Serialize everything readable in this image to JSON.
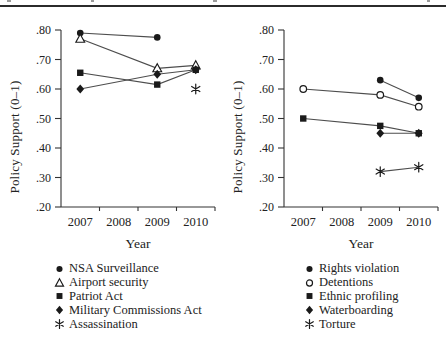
{
  "colors": {
    "ink": "#1a1a1a",
    "line": "#4d4d4d",
    "axis": "#333333",
    "text": "#222222",
    "rule": "#2b2b2b",
    "background": "#ffffff"
  },
  "chart_data": [
    {
      "type": "line",
      "panel": "left",
      "ylabel": "Policy Support (0–1)",
      "xlabel": "Year",
      "ylim": [
        0.2,
        0.8
      ],
      "grid": false,
      "legend_position": "below",
      "x_categories": [
        2007,
        2008,
        2009,
        2010
      ],
      "xtick_labels": [
        "2007",
        "2008",
        "2009",
        "2010"
      ],
      "ytick_values": [
        0.8,
        0.7,
        0.6,
        0.5,
        0.4,
        0.3,
        0.2
      ],
      "ytick_labels": [
        ".80",
        ".70",
        ".60",
        ".50",
        ".40",
        ".30",
        ".20"
      ],
      "series": [
        {
          "name": "NSA Surveillance",
          "marker": "filled-circle",
          "x": [
            2007,
            2009
          ],
          "y": [
            0.79,
            0.775
          ]
        },
        {
          "name": "Airport security",
          "marker": "open-triangle",
          "x": [
            2007,
            2009,
            2010
          ],
          "y": [
            0.77,
            0.67,
            0.68
          ]
        },
        {
          "name": "Patriot Act",
          "marker": "filled-square",
          "x": [
            2007,
            2009,
            2010
          ],
          "y": [
            0.655,
            0.615,
            0.665
          ]
        },
        {
          "name": "Military Commissions Act",
          "marker": "filled-diamond",
          "x": [
            2007,
            2009,
            2010
          ],
          "y": [
            0.6,
            0.65,
            0.665
          ]
        },
        {
          "name": "Assassination",
          "marker": "asterisk",
          "x": [
            2010
          ],
          "y": [
            0.6
          ]
        }
      ]
    },
    {
      "type": "line",
      "panel": "right",
      "ylabel": "Policy Support (0–1)",
      "xlabel": "Year",
      "ylim": [
        0.2,
        0.8
      ],
      "grid": false,
      "legend_position": "below",
      "x_categories": [
        2007,
        2008,
        2009,
        2010
      ],
      "xtick_labels": [
        "2007",
        "2008",
        "2009",
        "2010"
      ],
      "ytick_values": [
        0.8,
        0.7,
        0.6,
        0.5,
        0.4,
        0.3,
        0.2
      ],
      "ytick_labels": [
        ".80",
        ".70",
        ".60",
        ".50",
        ".40",
        ".30",
        ".20"
      ],
      "series": [
        {
          "name": "Rights violation",
          "marker": "filled-circle",
          "x": [
            2009,
            2010
          ],
          "y": [
            0.63,
            0.57
          ]
        },
        {
          "name": "Detentions",
          "marker": "open-circle",
          "x": [
            2007,
            2009,
            2010
          ],
          "y": [
            0.6,
            0.58,
            0.54
          ]
        },
        {
          "name": "Ethnic profiling",
          "marker": "filled-square",
          "x": [
            2007,
            2009,
            2010
          ],
          "y": [
            0.5,
            0.475,
            0.45
          ]
        },
        {
          "name": "Waterboarding",
          "marker": "filled-diamond",
          "x": [
            2009,
            2010
          ],
          "y": [
            0.45,
            0.45
          ]
        },
        {
          "name": "Torture",
          "marker": "asterisk",
          "x": [
            2009,
            2010
          ],
          "y": [
            0.32,
            0.335
          ]
        }
      ]
    }
  ]
}
